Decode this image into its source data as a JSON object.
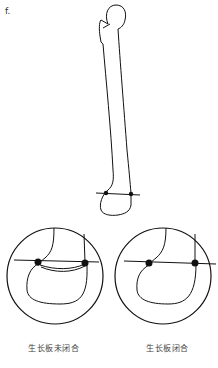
{
  "figure": {
    "panel_label": "f.",
    "insets": [
      {
        "caption": "生长板未闭合",
        "state": "growth-plate-open"
      },
      {
        "caption": "生长板闭合",
        "state": "growth-plate-closed"
      }
    ],
    "colors": {
      "line": "#111111",
      "background": "#ffffff",
      "text": "#444444"
    }
  }
}
